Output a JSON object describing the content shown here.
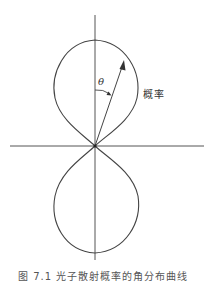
{
  "figure": {
    "type": "polar-probability-distribution",
    "labels": {
      "angle": "θ",
      "probability": "概率"
    },
    "caption": "图 7.1 光子散射概率的角分布曲线",
    "colors": {
      "stroke": "#444444",
      "background": "#ffffff",
      "text": "#333333"
    },
    "geometry": {
      "origin": [
        95,
        146
      ],
      "vertical_axis": {
        "x": 95,
        "y1": 15,
        "y2": 260
      },
      "horizontal_axis": {
        "y": 146,
        "x1": 10,
        "x2": 204
      },
      "upper_lobe": {
        "top_y": 40,
        "left_x": 53,
        "right_x": 137
      },
      "lower_lobe": {
        "bottom_y": 253,
        "left_x": 53,
        "right_x": 138
      },
      "arrow_tip": [
        124,
        62
      ]
    }
  }
}
